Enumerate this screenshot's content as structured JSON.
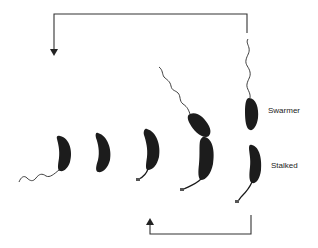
{
  "figure": {
    "labels": {
      "swarmer": "Swarmer",
      "stalked": "Stalked"
    },
    "stages": [
      {
        "id": 1,
        "description": "swarmer cell with polar flagellum"
      },
      {
        "id": 2,
        "description": "cell after flagellum loss"
      },
      {
        "id": 3,
        "description": "cell with stalk"
      },
      {
        "id": 4,
        "description": "predivisional cell with new flagellum"
      },
      {
        "id": 5,
        "description": "division into swarmer and stalked cells"
      }
    ],
    "arrows": {
      "top": "swarmer cell returns to start of cycle",
      "bottom": "stalked cell re-enters cycle at stalked stage"
    },
    "colors": {
      "cell": "#1c1c1c",
      "line": "#333333",
      "background": "#ffffff"
    }
  }
}
